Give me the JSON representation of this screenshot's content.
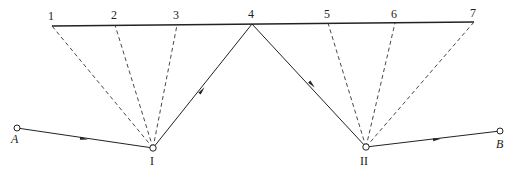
{
  "diagram": {
    "top_points": [
      {
        "label": "1",
        "x": 52,
        "y": 26
      },
      {
        "label": "2",
        "x": 115,
        "y": 25
      },
      {
        "label": "3",
        "x": 177,
        "y": 25
      },
      {
        "label": "4",
        "x": 252,
        "y": 24
      },
      {
        "label": "5",
        "x": 328,
        "y": 23
      },
      {
        "label": "6",
        "x": 395,
        "y": 23
      },
      {
        "label": "7",
        "x": 474,
        "y": 22
      }
    ],
    "stations": [
      {
        "label": "I",
        "x": 153,
        "y": 148
      },
      {
        "label": "II",
        "x": 366,
        "y": 147
      }
    ],
    "endpoints": [
      {
        "label": "A",
        "x": 17,
        "y": 128
      },
      {
        "label": "B",
        "x": 500,
        "y": 131
      }
    ],
    "line_color": "#222222"
  }
}
